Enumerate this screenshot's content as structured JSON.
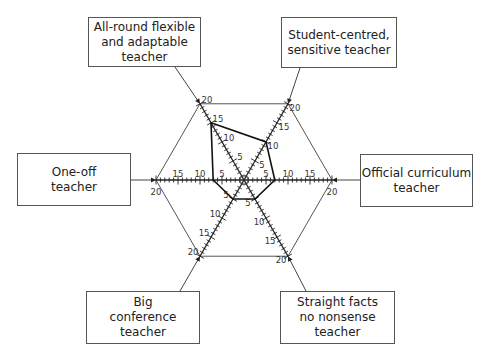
{
  "diagram": {
    "type": "radar",
    "axis_max": 20,
    "axis_ticks": [
      5,
      10,
      15,
      20
    ],
    "axes": [
      {
        "id": "all-round",
        "label": "All-round flexible and adaptable teacher",
        "label_lines": [
          "All-round flexible",
          "and adaptable",
          "teacher"
        ],
        "value": 15
      },
      {
        "id": "student-centred",
        "label": "Student-centred, sensitive teacher",
        "label_lines": [
          "Student-centred,",
          "sensitive teacher"
        ],
        "value": 10
      },
      {
        "id": "official-curriculum",
        "label": "Official curriculum teacher",
        "label_lines": [
          "Official curriculum",
          "teacher"
        ],
        "value": 7
      },
      {
        "id": "straight-facts",
        "label": "Straight facts no nonsense teacher",
        "label_lines": [
          "Straight facts",
          "no nonsense",
          "teacher"
        ],
        "value": 5
      },
      {
        "id": "big-conference",
        "label": "Big conference teacher",
        "label_lines": [
          "Big",
          "conference",
          "teacher"
        ],
        "value": 5
      },
      {
        "id": "one-off",
        "label": "One-off teacher",
        "label_lines": [
          "One-off",
          "teacher"
        ],
        "value": 7
      }
    ]
  }
}
